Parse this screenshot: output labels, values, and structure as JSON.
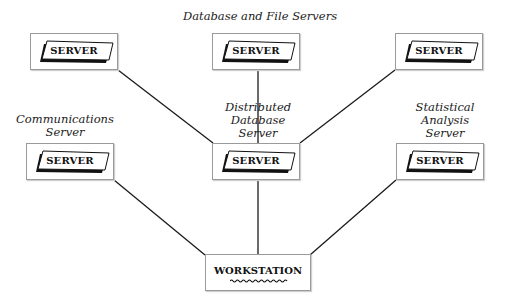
{
  "diagram": {
    "title": "Database and File Servers",
    "captions": {
      "communications": "Communications\nServer",
      "distributed": "Distributed\nDatabase\nServer",
      "statistical": "Statistical\nAnalysis\nServer"
    },
    "nodes": [
      {
        "id": "top-left",
        "label": "SERVER"
      },
      {
        "id": "top-middle",
        "label": "SERVER"
      },
      {
        "id": "top-right",
        "label": "SERVER"
      },
      {
        "id": "communications",
        "label": "SERVER"
      },
      {
        "id": "distributed",
        "label": "SERVER"
      },
      {
        "id": "statistical",
        "label": "SERVER"
      }
    ],
    "workstation": {
      "label": "WORKSTATION"
    },
    "edges": [
      [
        "top-left",
        "distributed"
      ],
      [
        "top-middle",
        "distributed"
      ],
      [
        "top-right",
        "distributed"
      ],
      [
        "communications",
        "workstation"
      ],
      [
        "distributed",
        "workstation"
      ],
      [
        "statistical",
        "workstation"
      ]
    ],
    "colors": {
      "line": "#1a1a1a",
      "box_border": "#9a9a9a",
      "text": "#111111"
    }
  }
}
